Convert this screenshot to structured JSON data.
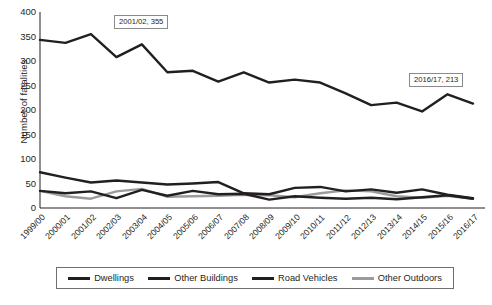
{
  "chart_data": {
    "type": "line",
    "title": "",
    "xlabel": "",
    "ylabel": "Number of fatalities",
    "ylim": [
      0,
      400
    ],
    "yticks": [
      0,
      50,
      100,
      150,
      200,
      250,
      300,
      350,
      400
    ],
    "grid": false,
    "legend_position": "bottom",
    "categories": [
      "1999/00",
      "2000/01",
      "2001/02",
      "2002/03",
      "2003/04",
      "2004/05",
      "2005/06",
      "2006/07",
      "2007/08",
      "2008/09",
      "2009/10",
      "2010/11",
      "2011/12",
      "2012/13",
      "2013/14",
      "2014/15",
      "2015/16",
      "2016/17"
    ],
    "series": [
      {
        "name": "Dwellings",
        "color": "#231f20",
        "values": [
          343,
          337,
          355,
          308,
          334,
          277,
          280,
          258,
          277,
          256,
          262,
          256,
          234,
          210,
          215,
          197,
          232,
          213
        ]
      },
      {
        "name": "Other Buildings",
        "color": "#231f20",
        "values": [
          73,
          62,
          52,
          56,
          52,
          48,
          50,
          53,
          30,
          28,
          41,
          43,
          34,
          38,
          31,
          38,
          27,
          20
        ]
      },
      {
        "name": "Road Vehicles",
        "color": "#231f20",
        "values": [
          35,
          30,
          34,
          20,
          37,
          25,
          35,
          28,
          29,
          17,
          24,
          21,
          19,
          21,
          18,
          22,
          26,
          19
        ]
      },
      {
        "name": "Other Outdoors",
        "color": "#9b9b9b",
        "values": [
          35,
          24,
          19,
          34,
          39,
          23,
          24,
          25,
          27,
          26,
          22,
          30,
          36,
          34,
          24,
          21,
          25,
          19
        ]
      }
    ],
    "annotations": [
      {
        "id": "peak",
        "label": "2001/02, 355",
        "category": "2001/02",
        "value": 355,
        "series": "Dwellings"
      },
      {
        "id": "last",
        "label": "2016/17, 213",
        "category": "2016/17",
        "value": 213,
        "series": "Dwellings"
      }
    ]
  },
  "legend": {
    "items": [
      {
        "label": "Dwellings",
        "color": "#231f20"
      },
      {
        "label": "Other Buildings",
        "color": "#231f20"
      },
      {
        "label": "Road Vehicles",
        "color": "#231f20"
      },
      {
        "label": "Other Outdoors",
        "color": "#9b9b9b"
      }
    ]
  }
}
